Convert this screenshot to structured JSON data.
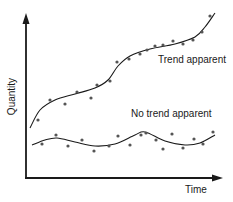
{
  "chart_data": {
    "type": "scatter",
    "title": "",
    "xlabel": "Time",
    "ylabel": "Quantity",
    "grid": false,
    "legend": "none (inline annotations)",
    "axes": {
      "x_ticks": [],
      "y_ticks": [],
      "arrows": true
    },
    "annotations": [
      "Trend apparent",
      "No trend apparent"
    ],
    "series": [
      {
        "name": "Trend apparent",
        "fit": "smooth increasing S-shaped trend curve",
        "points_px": [
          [
            38,
            120
          ],
          [
            50,
            100
          ],
          [
            65,
            104
          ],
          [
            77,
            92
          ],
          [
            91,
            98
          ],
          [
            97,
            85
          ],
          [
            110,
            81
          ],
          [
            117,
            62
          ],
          [
            129,
            59
          ],
          [
            140,
            54
          ],
          [
            147,
            50
          ],
          [
            155,
            46
          ],
          [
            163,
            45
          ],
          [
            173,
            41
          ],
          [
            183,
            44
          ],
          [
            193,
            40
          ],
          [
            202,
            32
          ],
          [
            210,
            16
          ]
        ],
        "curve_px": [
          [
            30,
            128
          ],
          [
            40,
            110
          ],
          [
            55,
            100
          ],
          [
            75,
            94
          ],
          [
            95,
            88
          ],
          [
            108,
            80
          ],
          [
            118,
            66
          ],
          [
            130,
            56
          ],
          [
            150,
            49
          ],
          [
            175,
            44
          ],
          [
            195,
            37
          ],
          [
            205,
            27
          ],
          [
            215,
            13
          ]
        ]
      },
      {
        "name": "No trend apparent",
        "fit": "smooth flat oscillating curve",
        "points_px": [
          [
            42,
            144
          ],
          [
            56,
            135
          ],
          [
            68,
            146
          ],
          [
            82,
            140
          ],
          [
            94,
            151
          ],
          [
            109,
            146
          ],
          [
            118,
            136
          ],
          [
            130,
            145
          ],
          [
            141,
            135
          ],
          [
            146,
            133
          ],
          [
            156,
            140
          ],
          [
            163,
            149
          ],
          [
            172,
            134
          ],
          [
            183,
            148
          ],
          [
            194,
            139
          ],
          [
            203,
            144
          ],
          [
            213,
            132
          ]
        ],
        "curve_px": [
          [
            32,
            145
          ],
          [
            45,
            140
          ],
          [
            57,
            138
          ],
          [
            75,
            142
          ],
          [
            95,
            146
          ],
          [
            115,
            144
          ],
          [
            135,
            135
          ],
          [
            145,
            132
          ],
          [
            165,
            141
          ],
          [
            185,
            145
          ],
          [
            200,
            143
          ],
          [
            215,
            135
          ]
        ]
      }
    ]
  },
  "labels": {
    "y_axis": "Quantity",
    "x_axis": "Time",
    "trend": "Trend apparent",
    "no_trend": "No trend apparent"
  },
  "colors": {
    "ink": "#1a1a1a",
    "background": "#ffffff"
  }
}
